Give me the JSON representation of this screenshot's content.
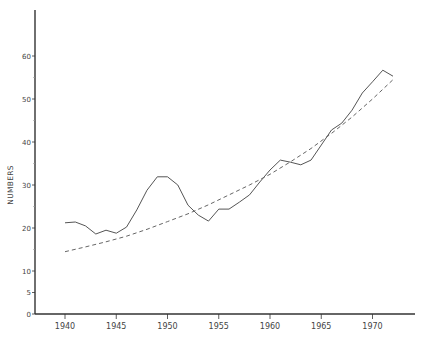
{
  "chart_data": {
    "type": "line",
    "title": "",
    "xlabel": "",
    "ylabel": "NUMBERS",
    "xlim": [
      1937,
      1974
    ],
    "ylim": [
      0,
      70
    ],
    "x_ticks": [
      1940,
      1945,
      1950,
      1955,
      1960,
      1965,
      1970
    ],
    "y_ticks": [
      0,
      5,
      10,
      20,
      30,
      40,
      50,
      60
    ],
    "grid": false,
    "legend": null,
    "series": [
      {
        "name": "observed",
        "style": "solid",
        "x": [
          1940,
          1941,
          1942,
          1943,
          1944,
          1945,
          1946,
          1947,
          1948,
          1949,
          1950,
          1951,
          1952,
          1953,
          1954,
          1955,
          1956,
          1957,
          1958,
          1959,
          1960,
          1961,
          1962,
          1963,
          1964,
          1965,
          1966,
          1967,
          1968,
          1969,
          1970,
          1971,
          1972
        ],
        "values": [
          21.2,
          21.4,
          20.5,
          18.6,
          19.5,
          18.8,
          20.2,
          24.2,
          28.8,
          31.9,
          31.9,
          30.0,
          25.3,
          23.0,
          21.6,
          24.4,
          24.4,
          26.0,
          27.7,
          30.7,
          33.5,
          35.8,
          35.3,
          34.7,
          35.8,
          39.3,
          42.8,
          44.4,
          47.4,
          51.4,
          54.0,
          56.7,
          55.3
        ]
      },
      {
        "name": "trend",
        "style": "dashed",
        "x": [
          1940,
          1942,
          1944,
          1946,
          1948,
          1950,
          1952,
          1954,
          1956,
          1958,
          1960,
          1962,
          1964,
          1966,
          1968,
          1970,
          1972
        ],
        "values": [
          14.5,
          15.6,
          16.8,
          18.1,
          19.7,
          21.5,
          23.3,
          25.4,
          27.7,
          30.0,
          32.5,
          35.4,
          38.5,
          42.0,
          45.8,
          50.0,
          54.5
        ]
      }
    ]
  },
  "axis": {
    "ylabel": "NUMBERS",
    "x_tick_labels": [
      "1940",
      "1945",
      "1950",
      "1955",
      "1960",
      "1965",
      "1970"
    ],
    "y_tick_labels": [
      "0",
      "5",
      "10",
      "20",
      "30",
      "40",
      "50",
      "60"
    ]
  },
  "colors": {
    "solid_line": "#555555",
    "dashed_line": "#666666",
    "axis": "#333333"
  }
}
